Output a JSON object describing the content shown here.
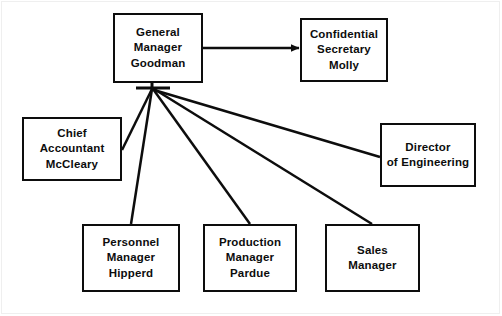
{
  "chart": {
    "line_color": "#0d0d0d",
    "background_color": "#ffffff",
    "hub": {
      "x": 152,
      "y": 88
    },
    "boxes": [
      {
        "id": "general-manager",
        "lines": [
          "General",
          "Manager",
          "Goodman"
        ]
      },
      {
        "id": "secretary",
        "lines": [
          "Confidential",
          "Secretary",
          "Molly"
        ]
      },
      {
        "id": "accountant",
        "lines": [
          "Chief",
          "Accountant",
          "McCleary"
        ]
      },
      {
        "id": "engineering",
        "lines": [
          "Director",
          "of Engineering"
        ]
      },
      {
        "id": "personnel",
        "lines": [
          "Personnel",
          "Manager",
          "Hipperd"
        ]
      },
      {
        "id": "production",
        "lines": [
          "Production",
          "Manager",
          "Pardue"
        ]
      },
      {
        "id": "sales",
        "lines": [
          "Sales",
          "Manager"
        ]
      }
    ]
  }
}
